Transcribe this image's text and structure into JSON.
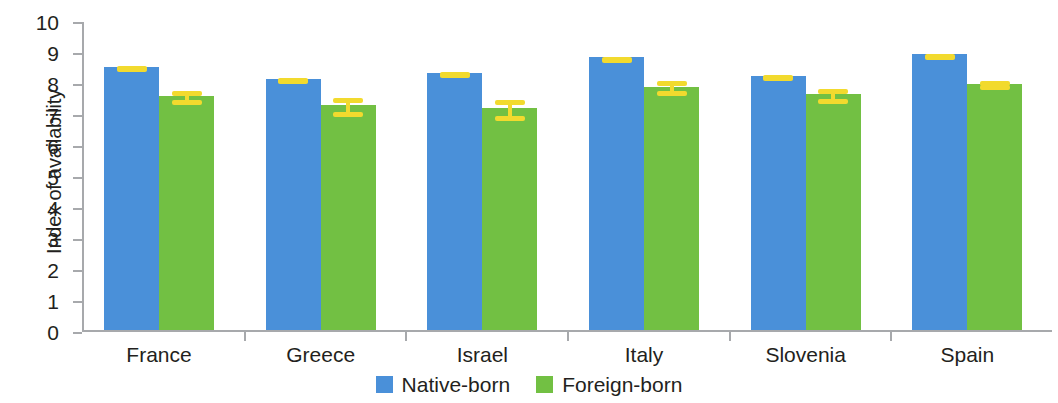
{
  "chart_data": {
    "type": "bar",
    "title": "",
    "xlabel": "",
    "ylabel": "Index of availability",
    "ylim": [
      0,
      10
    ],
    "ytick_labels": [
      "10",
      "9",
      "8",
      "7",
      "6",
      "5",
      "4",
      "3",
      "2",
      "1",
      "0"
    ],
    "grid": false,
    "legend_position": "bottom-center",
    "categories": [
      "France",
      "Greece",
      "Israel",
      "Italy",
      "Slovenia",
      "Spain"
    ],
    "series": [
      {
        "name": "Native-born",
        "color": "#4a90d9",
        "values": [
          8.5,
          8.1,
          8.3,
          8.8,
          8.2,
          8.9
        ],
        "errors": [
          0.08,
          0.1,
          0.08,
          0.07,
          0.1,
          0.07
        ]
      },
      {
        "name": "Foreign-born",
        "color": "#72c043",
        "values": [
          7.55,
          7.25,
          7.15,
          7.85,
          7.6,
          7.95
        ],
        "errors": [
          0.22,
          0.3,
          0.33,
          0.25,
          0.25,
          0.15
        ]
      }
    ],
    "error_bar_color": "#f2da2e",
    "axis_color": "#a7a9ac"
  },
  "legend": {
    "items": [
      {
        "label": "Native-born"
      },
      {
        "label": "Foreign-born"
      }
    ]
  }
}
